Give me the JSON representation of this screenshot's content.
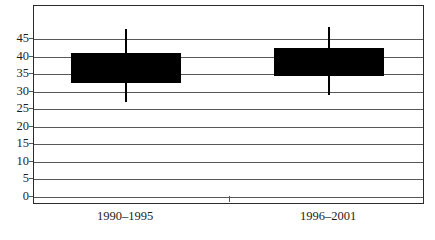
{
  "chart_data": {
    "type": "box",
    "title": "",
    "xlabel": "",
    "ylabel": "",
    "categories": [
      "1990–1995",
      "1996–2001"
    ],
    "ylim": [
      0,
      45
    ],
    "y_ticks": [
      0,
      5,
      10,
      15,
      20,
      25,
      30,
      35,
      40,
      45
    ],
    "y_tick_labels": [
      "0",
      "5",
      "10",
      "15",
      "20",
      "25",
      "30",
      "35",
      "40",
      "45"
    ],
    "grid": true,
    "legend": "none",
    "series": [
      {
        "name": "1990–1995",
        "whisker_high": 48,
        "box_top": 41,
        "box_bottom": 32.5,
        "whisker_low": 27
      },
      {
        "name": "1996–2001",
        "whisker_high": 48.5,
        "box_top": 42.5,
        "box_bottom": 34.5,
        "whisker_low": 29
      }
    ],
    "colors": {
      "box_fill": "#000000",
      "whisker": "#000000",
      "gridline": "#58585a",
      "frame": "#2b2b2b",
      "text": "#1d1d1d",
      "background": "#ffffff"
    }
  }
}
